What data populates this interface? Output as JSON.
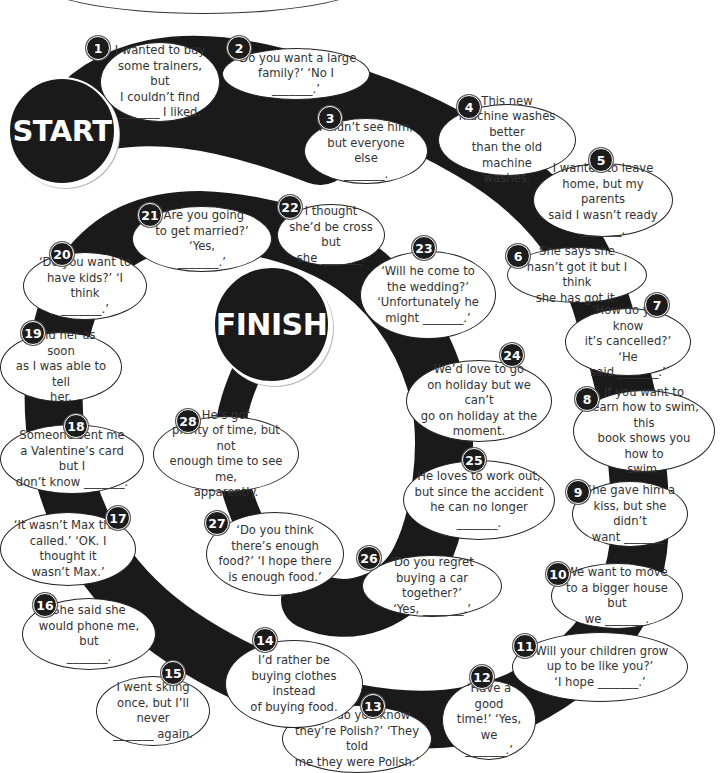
{
  "board": {
    "start_label": "START",
    "finish_label": "FINISH",
    "colors": {
      "track": "#1a1a1a",
      "bubble_bg": "#ffffff",
      "bubble_border": "#222222",
      "text": "#333333",
      "number_bg": "#1c1c1c"
    },
    "squares": [
      {
        "number": "1",
        "text": "I wanted to buy\nsome trainers, but\nI couldn’t find\n_______ I liked."
      },
      {
        "number": "2",
        "text": "‘Do you want a large\nfamily?’  ‘No I _______.’"
      },
      {
        "number": "3",
        "text": "I didn’t see him,\nbut everyone else\n_______."
      },
      {
        "number": "4",
        "text": "This new\nmachine washes better\nthan the old machine\nwashes."
      },
      {
        "number": "5",
        "text": "I wanted to leave\nhome, but my parents\nsaid I wasn’t ready\n_______."
      },
      {
        "number": "6",
        "text": "She says she\nhasn’t got it but I think\nshe has got it."
      },
      {
        "number": "7",
        "text": "‘How do you know\nit’s cancelled?’ ‘He\nsaid _______.’"
      },
      {
        "number": "8",
        "text": "If you want to\nlearn how to swim, this\nbook shows you how to\nswim."
      },
      {
        "number": "9",
        "text": "She gave him a\nkiss, but she didn’t\nwant _______."
      },
      {
        "number": "10",
        "text": "We want to move\nto a bigger house but\nwe _______."
      },
      {
        "number": "11",
        "text": "‘Will your children grow\nup to be like you?’\n‘I hope _______.’"
      },
      {
        "number": "12",
        "text": "‘Have a good\ntime!’ ‘Yes, we\n_______.’"
      },
      {
        "number": "13",
        "text": "‘How do you know\nthey’re Polish?’ ‘They told\nme they were Polish.’"
      },
      {
        "number": "14",
        "text": "I’d rather be\nbuying clothes instead\nof buying food."
      },
      {
        "number": "15",
        "text": "I went skiing\nonce, but I’ll never\n_______ again."
      },
      {
        "number": "16",
        "text": "She said she\nwould phone me, but\n_______."
      },
      {
        "number": "17",
        "text": "‘It wasn’t Max that\ncalled.’ ‘OK. I thought it\nwasn’t Max.’"
      },
      {
        "number": "18",
        "text": "Someone sent me\na Valentine’s card but I\ndon’t know _______."
      },
      {
        "number": "19",
        "text": "I told her as soon\nas I was able to tell\nher."
      },
      {
        "number": "20",
        "text": "‘Do you want to\nhave kids?’ ‘I think\n_______.’"
      },
      {
        "number": "21",
        "text": "‘Are you going\nto get married?’ ‘Yes,\n_______.’"
      },
      {
        "number": "22",
        "text": "I thought\nshe’d be cross but\nshe _______."
      },
      {
        "number": "23",
        "text": "‘Will he come to\nthe wedding?’\n‘Unfortunately he\nmight _______.’"
      },
      {
        "number": "24",
        "text": "We’d love to go\non holiday but we can’t\ngo on holiday at the\nmoment."
      },
      {
        "number": "25",
        "text": "He loves to work out,\nbut since the accident\nhe can no longer\n_______."
      },
      {
        "number": "26",
        "text": "‘Do you regret\nbuying a car together?’\n‘Yes, _______.’"
      },
      {
        "number": "27",
        "text": "‘Do you think\nthere’s enough\nfood?’ ‘I hope there\nis enough food.’"
      },
      {
        "number": "28",
        "text": "He’s got\nplenty of time, but not\nenough time to see me,\napparently."
      }
    ]
  }
}
